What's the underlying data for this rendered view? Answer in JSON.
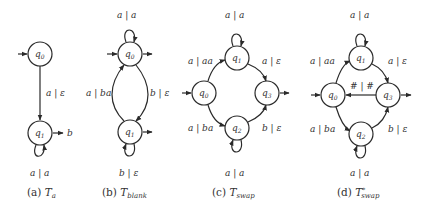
{
  "diagrams": [
    {
      "id": "a",
      "caption_prefix": "(a)",
      "caption_symbol": "T",
      "caption_sub": "a",
      "caption_sup": "",
      "states": [
        {
          "name": "q0",
          "label": "q",
          "sub": "0",
          "initial": true,
          "final": false
        },
        {
          "name": "q1",
          "label": "q",
          "sub": "1",
          "initial": false,
          "final": true,
          "final_output": "b"
        }
      ],
      "transitions": [
        {
          "from": "q0",
          "to": "q1",
          "label": "a | ε"
        },
        {
          "from": "q1",
          "to": "q1",
          "label": "a | a"
        }
      ]
    },
    {
      "id": "b",
      "caption_prefix": "(b)",
      "caption_symbol": "T",
      "caption_sub": "blank",
      "caption_sup": "",
      "states": [
        {
          "name": "q0",
          "label": "q",
          "sub": "0",
          "initial": true,
          "final": true
        },
        {
          "name": "q1",
          "label": "q",
          "sub": "1",
          "initial": false,
          "final": true
        }
      ],
      "transitions": [
        {
          "from": "q0",
          "to": "q0",
          "label": "a | a"
        },
        {
          "from": "q0",
          "to": "q1",
          "label": "b | ε"
        },
        {
          "from": "q1",
          "to": "q0",
          "label": "a | ba"
        },
        {
          "from": "q1",
          "to": "q1",
          "label": "b | ε"
        }
      ]
    },
    {
      "id": "c",
      "caption_prefix": "(c)",
      "caption_symbol": "T",
      "caption_sub": "swap",
      "caption_sup": "",
      "states": [
        {
          "name": "q0",
          "label": "q",
          "sub": "0",
          "initial": true,
          "final": false
        },
        {
          "name": "q1",
          "label": "q",
          "sub": "1",
          "initial": false,
          "final": false
        },
        {
          "name": "q2",
          "label": "q",
          "sub": "2",
          "initial": false,
          "final": false
        },
        {
          "name": "q3",
          "label": "q",
          "sub": "3",
          "initial": false,
          "final": true
        }
      ],
      "transitions": [
        {
          "from": "q0",
          "to": "q1",
          "label": "a | aa"
        },
        {
          "from": "q1",
          "to": "q1",
          "label": "a | a"
        },
        {
          "from": "q1",
          "to": "q3",
          "label": "a | ε"
        },
        {
          "from": "q0",
          "to": "q2",
          "label": "a | ba"
        },
        {
          "from": "q2",
          "to": "q2",
          "label": "a | a"
        },
        {
          "from": "q2",
          "to": "q3",
          "label": "b | ε"
        }
      ]
    },
    {
      "id": "d",
      "caption_prefix": "(d)",
      "caption_symbol": "T",
      "caption_sub": "swap",
      "caption_sup": "*",
      "states": [
        {
          "name": "q0",
          "label": "q",
          "sub": "0",
          "initial": true,
          "final": false
        },
        {
          "name": "q1",
          "label": "q",
          "sub": "1",
          "initial": false,
          "final": false
        },
        {
          "name": "q2",
          "label": "q",
          "sub": "2",
          "initial": false,
          "final": false
        },
        {
          "name": "q3",
          "label": "q",
          "sub": "3",
          "initial": false,
          "final": true
        }
      ],
      "transitions": [
        {
          "from": "q0",
          "to": "q1",
          "label": "a | aa"
        },
        {
          "from": "q1",
          "to": "q1",
          "label": "a | a"
        },
        {
          "from": "q1",
          "to": "q3",
          "label": "a | ε"
        },
        {
          "from": "q0",
          "to": "q2",
          "label": "a | ba"
        },
        {
          "from": "q2",
          "to": "q2",
          "label": "a | a"
        },
        {
          "from": "q2",
          "to": "q3",
          "label": "b | ε"
        },
        {
          "from": "q3",
          "to": "q0",
          "label": "# | #"
        }
      ]
    }
  ]
}
